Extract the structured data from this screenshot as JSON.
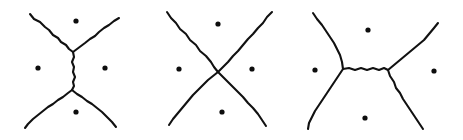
{
  "figure": {
    "title": "Steiner network configurations joining four points",
    "background_color": "#ffffff",
    "stroke_color": "#111111",
    "dot_color": "#0d0d0d",
    "width": 463,
    "height": 140,
    "panel_count": 3,
    "style": "hand-drawn wobbly ink lines"
  },
  "panels": [
    {
      "id": "panel-left",
      "name": "vertical-steiner-tree",
      "label": "",
      "description": "Two Y-junctions joined by a short vertical segment; four arms reach toward the corners",
      "junctions": [
        {
          "name": "upper-junction",
          "x": 73,
          "y": 52
        },
        {
          "name": "lower-junction",
          "x": 72,
          "y": 90
        }
      ],
      "dots": [
        {
          "name": "top-dot",
          "x": 76,
          "y": 21,
          "r": 2.6
        },
        {
          "name": "left-dot",
          "x": 38,
          "y": 68,
          "r": 2.6
        },
        {
          "name": "right-dot",
          "x": 105,
          "y": 68,
          "r": 2.6
        },
        {
          "name": "bottom-dot",
          "x": 76,
          "y": 112,
          "r": 2.6
        }
      ],
      "paths": [
        {
          "name": "upper-left-arm",
          "d": "M 30 14 L 34 19 L 40 22 L 45 27 L 49 30 L 53 35 L 58 38 L 61 42 L 66 45 L 69 49 L 73 52"
        },
        {
          "name": "upper-right-arm",
          "d": "M 119 18 L 114 21 L 109 25 L 104 28 L 99 32 L 95 36 L 90 39 L 85 43 L 81 46 L 77 49 L 73 52"
        },
        {
          "name": "central-spine",
          "d": "M 73 52 L 74 57 L 72 62 L 74 67 L 73 72 L 75 77 L 73 82 L 74 86 L 72 90"
        },
        {
          "name": "lower-left-arm",
          "d": "M 72 90 L 68 93 L 63 97 L 58 100 L 53 104 L 48 107 L 43 111 L 38 115 L 33 119 L 28 124 L 25 128"
        },
        {
          "name": "lower-right-arm",
          "d": "M 72 90 L 77 94 L 82 97 L 87 101 L 92 104 L 97 108 L 102 112 L 107 117 L 112 122 L 116 127"
        }
      ]
    },
    {
      "id": "panel-middle",
      "name": "crossed-x-configuration",
      "label": "",
      "description": "Degenerate configuration: the two diagonals cross at a single point in the middle",
      "junctions": [
        {
          "name": "crossing-point",
          "x": 218,
          "y": 72
        }
      ],
      "dots": [
        {
          "name": "top-dot",
          "x": 218,
          "y": 24,
          "r": 2.6
        },
        {
          "name": "left-dot",
          "x": 179,
          "y": 69,
          "r": 2.6
        },
        {
          "name": "right-dot",
          "x": 252,
          "y": 69,
          "r": 2.6
        },
        {
          "name": "bottom-dot",
          "x": 222,
          "y": 112,
          "r": 2.6
        }
      ],
      "paths": [
        {
          "name": "diagonal-upper-left-to-lower-right",
          "d": "M 167 12 L 171 18 L 176 23 L 180 29 L 186 34 L 190 40 L 196 45 L 200 51 L 206 56 L 211 62 L 214 67 L 218 72 L 223 77 L 228 82 L 233 87 L 238 92 L 243 97 L 248 103 L 253 108 L 258 114 L 262 120 L 266 126"
        },
        {
          "name": "diagonal-upper-right-to-lower-left",
          "d": "M 272 12 L 267 17 L 263 23 L 258 28 L 253 34 L 248 39 L 243 45 L 238 51 L 233 56 L 228 62 L 223 67 L 218 72 L 213 76 L 208 80 L 203 85 L 198 90 L 193 95 L 188 101 L 183 107 L 178 113 L 173 119 L 169 125"
        }
      ]
    },
    {
      "id": "panel-right",
      "name": "horizontal-steiner-tree",
      "label": "",
      "description": "Two Y-junctions joined by a horizontal segment; four arms reach toward the corners",
      "junctions": [
        {
          "name": "left-junction",
          "x": 343,
          "y": 69
        },
        {
          "name": "right-junction",
          "x": 388,
          "y": 70
        }
      ],
      "dots": [
        {
          "name": "top-dot",
          "x": 368,
          "y": 30,
          "r": 2.6
        },
        {
          "name": "left-dot",
          "x": 315,
          "y": 70,
          "r": 2.6
        },
        {
          "name": "right-dot",
          "x": 434,
          "y": 71,
          "r": 2.6
        },
        {
          "name": "bottom-dot",
          "x": 365,
          "y": 118,
          "r": 2.6
        }
      ],
      "paths": [
        {
          "name": "upper-left-arm",
          "d": "M 313 13 L 317 19 L 322 25 L 326 31 L 330 37 L 334 43 L 337 49 L 340 55 L 342 62 L 343 69"
        },
        {
          "name": "central-bar",
          "d": "M 343 69 L 349 68 L 355 70 L 361 68 L 367 70 L 373 68 L 379 70 L 384 68 L 388 70"
        },
        {
          "name": "upper-right-arm",
          "d": "M 388 70 L 394 65 L 400 60 L 406 55 L 412 50 L 418 45 L 424 40 L 429 34 L 434 28 L 438 23"
        },
        {
          "name": "lower-left-arm",
          "d": "M 343 69 L 339 75 L 335 81 L 331 87 L 327 93 L 323 99 L 319 105 L 315 111 L 312 117 L 309 123 L 308 129"
        },
        {
          "name": "lower-right-arm",
          "d": "M 388 70 L 390 76 L 394 82 L 396 88 L 400 93 L 403 99 L 407 105 L 411 111 L 415 117 L 419 123 L 423 129"
        }
      ]
    }
  ]
}
